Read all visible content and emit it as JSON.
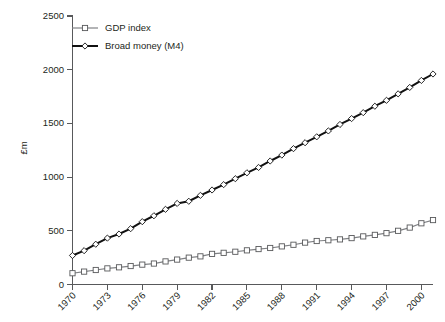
{
  "chart_data": {
    "type": "line",
    "title": "",
    "xlabel": "",
    "ylabel": "£m",
    "ylim": [
      0,
      2500
    ],
    "yticks": [
      0,
      500,
      1000,
      1500,
      2000,
      2500
    ],
    "ytick_labels": [
      "0",
      "500",
      "1000",
      "1500",
      "2000",
      "2500"
    ],
    "xlim": [
      1970,
      2001
    ],
    "xticks": [
      1970,
      1973,
      1976,
      1979,
      1982,
      1985,
      1988,
      1991,
      1994,
      1997,
      2000
    ],
    "xtick_labels": [
      "1970",
      "1973",
      "1976",
      "1979",
      "1982",
      "1985",
      "1988",
      "1991",
      "1994",
      "1997",
      "2000"
    ],
    "grid": false,
    "legend_position": "top-left",
    "x": [
      1970,
      1971,
      1972,
      1973,
      1974,
      1975,
      1976,
      1977,
      1978,
      1979,
      1980,
      1981,
      1982,
      1983,
      1984,
      1985,
      1986,
      1987,
      1988,
      1989,
      1990,
      1991,
      1992,
      1993,
      1994,
      1995,
      1996,
      1997,
      1998,
      1999,
      2000,
      2001
    ],
    "series": [
      {
        "name": "GDP index",
        "marker": "square",
        "color": "#808285",
        "values": [
          105,
          120,
          135,
          150,
          160,
          172,
          185,
          195,
          215,
          232,
          250,
          262,
          285,
          295,
          305,
          318,
          330,
          340,
          355,
          370,
          390,
          405,
          412,
          420,
          432,
          448,
          462,
          478,
          500,
          530,
          570,
          600
        ]
      },
      {
        "name": "Broad money (M4)",
        "marker": "diamond",
        "color": "#111111",
        "values": [
          270,
          315,
          375,
          432,
          470,
          520,
          585,
          640,
          700,
          755,
          775,
          830,
          880,
          930,
          985,
          1040,
          1090,
          1150,
          1205,
          1265,
          1320,
          1375,
          1430,
          1490,
          1545,
          1600,
          1660,
          1715,
          1775,
          1835,
          1900,
          1960
        ]
      }
    ],
    "legend": [
      {
        "label": "GDP index",
        "marker": "square",
        "color": "#808285"
      },
      {
        "label": "Broad money (M4)",
        "marker": "diamond",
        "color": "#111111"
      }
    ]
  },
  "axis": {
    "y_title": "£m"
  }
}
